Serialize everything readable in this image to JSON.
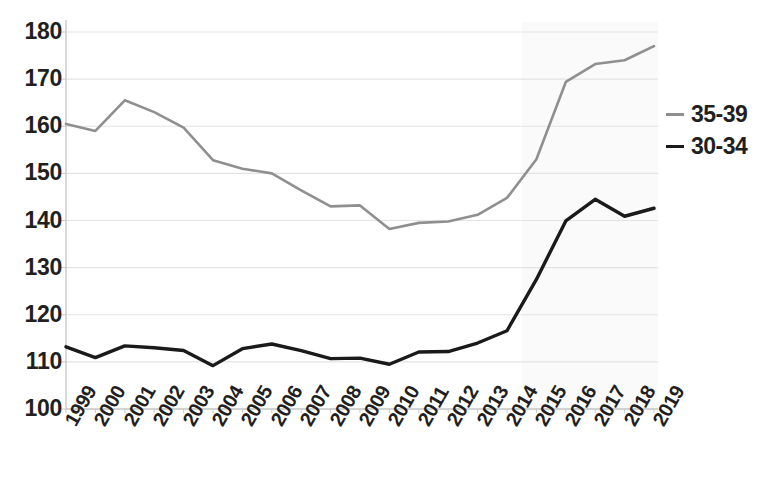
{
  "chart_data": {
    "type": "line",
    "title": "",
    "xlabel": "",
    "ylabel": "",
    "categories": [
      "1999",
      "2000",
      "2001",
      "2002",
      "2003",
      "2004",
      "2005",
      "2006",
      "2007",
      "2008",
      "2009",
      "2010",
      "2011",
      "2012",
      "2013",
      "2014",
      "2015",
      "2016",
      "2017",
      "2018",
      "2019"
    ],
    "series": [
      {
        "name": "35-39",
        "color": "#8f8f8f",
        "values": [
          160.5,
          159.0,
          165.5,
          163.0,
          159.7,
          152.8,
          151.0,
          150.0,
          146.4,
          143.0,
          143.2,
          138.2,
          139.5,
          139.8,
          141.2,
          144.8,
          153.0,
          169.4,
          173.2,
          174.0,
          177.0
        ]
      },
      {
        "name": "30-34",
        "color": "#1a1a1a",
        "values": [
          113.2,
          110.9,
          113.4,
          113.0,
          112.4,
          109.2,
          112.8,
          113.8,
          112.4,
          110.7,
          110.8,
          109.5,
          112.1,
          112.2,
          114.0,
          116.6,
          127.5,
          139.9,
          144.5,
          140.9,
          142.6
        ]
      }
    ],
    "ylim": [
      100,
      180
    ],
    "ytick_values": [
      100,
      110,
      120,
      130,
      140,
      150,
      160,
      170,
      180
    ],
    "ytick_labels": [
      "100",
      "110",
      "120",
      "130",
      "140",
      "150",
      "160",
      "170",
      "180"
    ],
    "grid": true,
    "grid_color": "#e3e3e3",
    "legend_position": "right",
    "shaded_region": {
      "label": "",
      "start_category": "2014",
      "end_category": "2019",
      "color": "#fafafa"
    },
    "annotations": []
  },
  "axis": {
    "axis_color": "#c9c9c9"
  },
  "legend": {
    "items": [
      {
        "label": "35-39",
        "color": "#8f8f8f"
      },
      {
        "label": "30-34",
        "color": "#1a1a1a"
      }
    ]
  },
  "header": {
    "cropped_title": ""
  }
}
